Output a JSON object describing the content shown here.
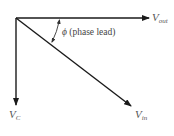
{
  "diagram": {
    "type": "phasor",
    "colors": {
      "line": "#1a1a1a",
      "label": "#555555"
    },
    "phasors": [
      {
        "id": "vout",
        "symbol": "V",
        "subscript": "out",
        "direction": "horizontal-right"
      },
      {
        "id": "vc",
        "symbol": "V",
        "subscript": "C",
        "direction": "vertical-down"
      },
      {
        "id": "vin",
        "symbol": "V",
        "subscript": "in",
        "direction": "diagonal-down-right"
      }
    ],
    "angle": {
      "symbol": "ϕ",
      "text": "(phase lead)",
      "between": [
        "vout",
        "vin"
      ]
    }
  }
}
